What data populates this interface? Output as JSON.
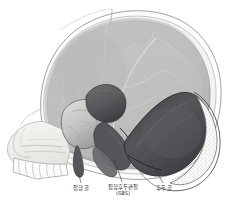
{
  "figure": {
    "background_color": "#ffffff",
    "frame_color": "#e8e8e8",
    "ink_color": "#2a2a2a"
  },
  "labels": {
    "sphenoid": {
      "text": "접형골",
      "abbr": ""
    },
    "sbs": {
      "text": "접형후두관절",
      "abbr": "(SBS)"
    },
    "occiput": {
      "text": "후두골",
      "abbr": ""
    }
  },
  "regions": {
    "cranial_vault": {
      "name": "cranial-vault",
      "fill": "#b9bbba"
    },
    "outer_table": {
      "name": "outer-table",
      "fill": "#f4f4f2"
    },
    "sphenoid_body": {
      "name": "sphenoid-bone",
      "fill": "#c9cac7"
    },
    "sphenoid_dark": {
      "name": "sphenoid-greater-wing",
      "fill": "#5b5c5c"
    },
    "occipital_bone": {
      "name": "occipital-bone",
      "fill": "#4a4b4d"
    },
    "facial_skeleton": {
      "name": "facial-skeleton",
      "fill": "#f0efec"
    },
    "teeth": {
      "name": "maxillary-teeth",
      "fill": "#fbfbf8"
    }
  }
}
